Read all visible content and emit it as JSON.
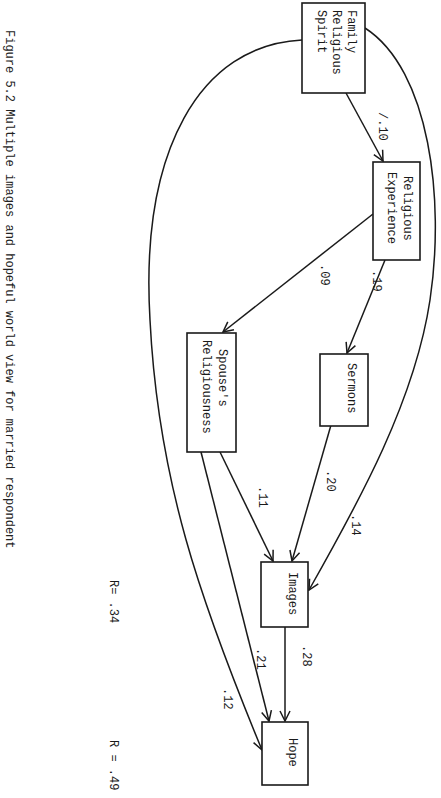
{
  "caption": "Figure 5.2  Multiple images and hopeful world view for married respondent",
  "nodes": {
    "family_religious_spirit": {
      "lines": [
        "Family",
        "Religious",
        "Spirit"
      ]
    },
    "religious_experience": {
      "lines": [
        "Religious",
        "Experience"
      ]
    },
    "sermons": {
      "lines": [
        "Sermons"
      ]
    },
    "spouses_religiousness": {
      "lines": [
        "Spouse's",
        "Religiousness"
      ]
    },
    "images": {
      "lines": [
        "Images"
      ]
    },
    "hope": {
      "lines": [
        "Hope"
      ]
    }
  },
  "edges": [
    {
      "from": "Family Religious Spirit",
      "to": "Religious Experience",
      "label": "/.10"
    },
    {
      "from": "Religious Experience",
      "to": "Sermons",
      "label": ".19"
    },
    {
      "from": "Religious Experience",
      "to": "Spouse's Religiousness",
      "label": ".09"
    },
    {
      "from": "Family Religious Spirit",
      "to": "Images",
      "label": ".14"
    },
    {
      "from": "Sermons",
      "to": "Images",
      "label": ".20"
    },
    {
      "from": "Spouse's Religiousness",
      "to": "Images",
      "label": ".11"
    },
    {
      "from": "Images",
      "to": "Hope",
      "label": ".28"
    },
    {
      "from": "Spouse's Religiousness",
      "to": "Hope",
      "label": ".21"
    },
    {
      "from": "Family Religious Spirit",
      "to": "Hope",
      "label": ".12"
    }
  ],
  "r_values": {
    "images": "R= .34",
    "hope": "R = .49"
  }
}
